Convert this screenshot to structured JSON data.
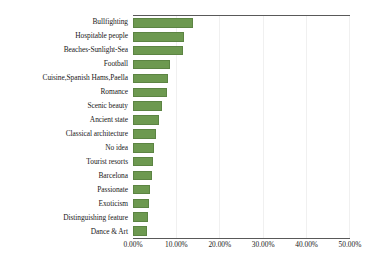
{
  "chart_data": {
    "type": "bar",
    "orientation": "horizontal",
    "title": "",
    "xlabel": "",
    "ylabel": "",
    "xlim": [
      0,
      50
    ],
    "grid": true,
    "legend": null,
    "bar_color": "#6d9950",
    "axis_color": "#595959",
    "gridline_color": "#f0f0f0",
    "tick_suffix": "%",
    "categories": [
      "Bullfighting",
      "Hospitable people",
      "Beaches-Sunlight-Sea",
      "Football",
      "Cuisine,Spanish Hams,Paella",
      "Romance",
      "Scenic beauty",
      "Ancient state",
      "Classical architecture",
      "No idea",
      "Tourist resorts",
      "Barcelona",
      "Passionate",
      "Exoticism",
      "Distinguishing feature",
      "Dance & Art"
    ],
    "values": [
      13.8,
      11.9,
      11.5,
      8.5,
      8.0,
      7.9,
      6.6,
      6.0,
      5.3,
      4.9,
      4.7,
      4.5,
      3.9,
      3.6,
      3.4,
      3.2
    ],
    "xticks": [
      0,
      10,
      20,
      30,
      40,
      50
    ],
    "xticklabels": [
      "0.00%",
      "10.00%",
      "20.00%",
      "30.00%",
      "40.00%",
      "50.00%"
    ]
  }
}
